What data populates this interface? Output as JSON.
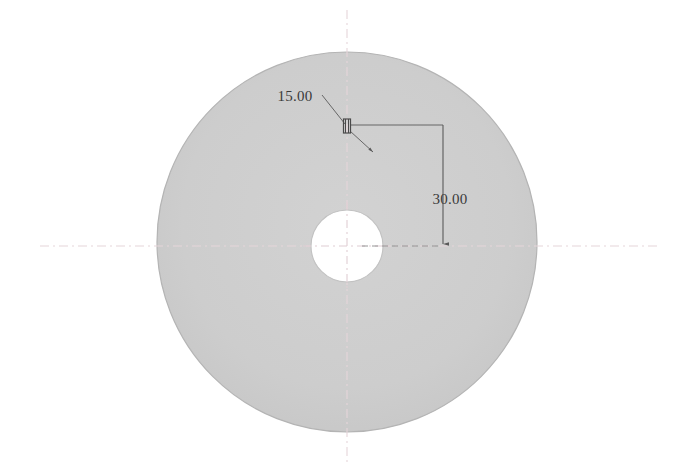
{
  "drawing": {
    "title": "Circular Disc Part Drawing",
    "background_color": "#ffffff",
    "part": {
      "name": "disc",
      "fill_color": "#cdcdcd",
      "edge_color": "#b4b4b4",
      "center_x": 347,
      "center_y": 242,
      "radius": 190
    },
    "center_hole": {
      "name": "center-bore",
      "fill_color": "#ffffff",
      "edge_color": "#c2c2c2",
      "center_x": 347,
      "center_y": 246,
      "radius": 36
    },
    "slot_feature": {
      "name": "small-slot",
      "center_x": 347,
      "center_y": 126,
      "width": 7,
      "height": 14,
      "color": "#4a4a4a"
    },
    "centerlines": {
      "color": "#e8d8dc",
      "horizontal_y": 246,
      "horizontal_x1": 40,
      "horizontal_x2": 660,
      "vertical_x": 347,
      "vertical_y1": 10,
      "vertical_y2": 462,
      "dash_pattern": "9 4 2 4"
    },
    "dimensions": [
      {
        "id": "diameter-callout",
        "label": "15.00",
        "text_x": 295,
        "text_y": 101,
        "leader_color": "#5a5a5a",
        "leader_from_x": 322,
        "leader_from_y": 95,
        "leader_to_x": 347,
        "leader_to_y": 126,
        "leader_tail_x": 372,
        "leader_tail_y": 151
      },
      {
        "id": "vertical-distance",
        "label": "30.00",
        "text_x": 427,
        "text_y": 204,
        "line_color": "#5a5a5a",
        "horiz_x1": 347,
        "horiz_x2": 443,
        "horiz_y": 125,
        "vert_x": 443,
        "vert_y1": 125,
        "vert_y2": 246,
        "ext_dash_x1": 360,
        "ext_dash_x2": 443,
        "ext_dash_y": 246
      }
    ]
  }
}
